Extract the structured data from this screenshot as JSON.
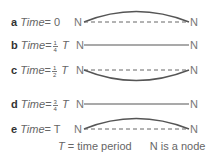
{
  "rows": [
    {
      "letter": "a",
      "time_word": "Time",
      "eq": "= 0",
      "frac_num": "",
      "frac_den": "",
      "T": "",
      "node_left": "N",
      "node_right": "N",
      "shape": "arc-up-with-dashed-baseline"
    },
    {
      "letter": "b",
      "time_word": "Time",
      "eq": "=",
      "frac_num": "1",
      "frac_den": "4",
      "T": "T",
      "node_left": "N",
      "node_right": "N",
      "shape": "straight-line"
    },
    {
      "letter": "c",
      "time_word": "Time",
      "eq": "=",
      "frac_num": "1",
      "frac_den": "2",
      "T": "T",
      "node_left": "N",
      "node_right": "N",
      "shape": "arc-down-with-dashed-baseline"
    },
    {
      "letter": "d",
      "time_word": "Time",
      "eq": "=",
      "frac_num": "3",
      "frac_den": "4",
      "T": "T",
      "node_left": "N",
      "node_right": "N",
      "shape": "straight-line"
    },
    {
      "letter": "e",
      "time_word": "Time",
      "eq": "= T",
      "frac_num": "",
      "frac_den": "",
      "T": "",
      "node_left": "N",
      "node_right": "N",
      "shape": "arc-up-with-dashed-baseline"
    }
  ],
  "caption": {
    "T_symbol": "T",
    "T_def": "= time period",
    "N_def": "N is a node"
  },
  "colors": {
    "line": "#555555",
    "dashed": "#666666",
    "text": "#666666"
  }
}
